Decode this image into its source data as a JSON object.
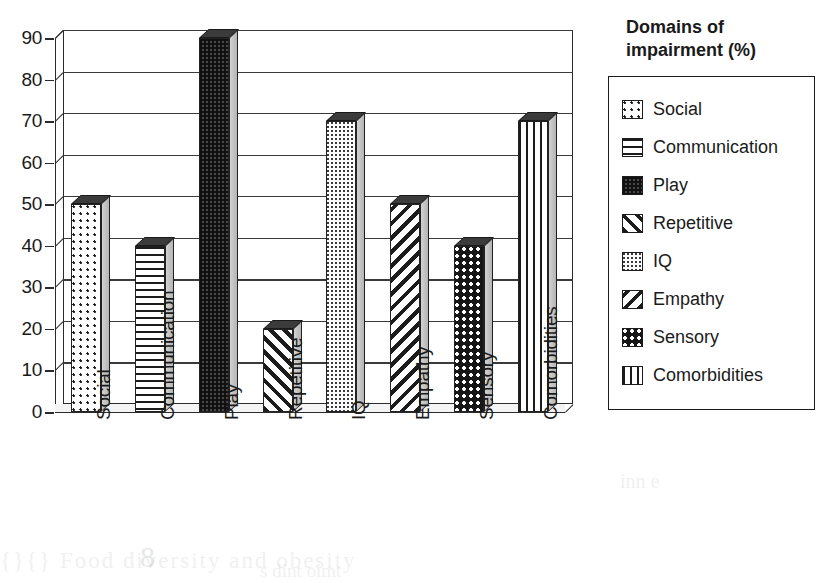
{
  "chart_data": {
    "type": "bar",
    "title": "",
    "xlabel": "",
    "ylabel": "",
    "ylim": [
      0,
      90
    ],
    "ytick_step": 10,
    "yticks": [
      0,
      10,
      20,
      30,
      40,
      50,
      60,
      70,
      80,
      90
    ],
    "grid": true,
    "legend_position": "right",
    "legend_title": "Domains of\nimpairment (%)",
    "categories": [
      "Social",
      "Communication",
      "Play",
      "Repetitive",
      "IQ",
      "Empathy",
      "Sensory",
      "Comorbidities"
    ],
    "values": [
      50,
      40,
      90,
      20,
      70,
      50,
      40,
      70
    ],
    "series": [
      {
        "name": "Domains of impairment (%)",
        "values": [
          50,
          40,
          90,
          20,
          70,
          50,
          40,
          70
        ]
      }
    ],
    "points": [
      {
        "category": "Social",
        "value": 50,
        "pattern": "sparse-dots"
      },
      {
        "category": "Communication",
        "value": 40,
        "pattern": "horizontal-lines"
      },
      {
        "category": "Play",
        "value": 90,
        "pattern": "dense-checker"
      },
      {
        "category": "Repetitive",
        "value": 20,
        "pattern": "diagonal-forward"
      },
      {
        "category": "IQ",
        "value": 70,
        "pattern": "fine-dots"
      },
      {
        "category": "Empathy",
        "value": 50,
        "pattern": "diagonal-backward"
      },
      {
        "category": "Sensory",
        "value": 40,
        "pattern": "dark-dots"
      },
      {
        "category": "Comorbidities",
        "value": 70,
        "pattern": "vertical-lines"
      }
    ]
  },
  "legend": {
    "title": "Domains of\nimpairment (%)",
    "items": [
      {
        "label": "Social",
        "pattern": "sparse-dots"
      },
      {
        "label": "Communication",
        "pattern": "horizontal-lines"
      },
      {
        "label": "Play",
        "pattern": "dense-checker"
      },
      {
        "label": "Repetitive",
        "pattern": "diagonal-forward"
      },
      {
        "label": "IQ",
        "pattern": "fine-dots"
      },
      {
        "label": "Empathy",
        "pattern": "diagonal-backward"
      },
      {
        "label": "Sensory",
        "pattern": "dark-dots"
      },
      {
        "label": "Comorbidities",
        "pattern": "vertical-lines"
      }
    ]
  },
  "axis": {
    "y_labels": [
      "90",
      "80",
      "70",
      "60",
      "50",
      "40",
      "30",
      "20",
      "10",
      "0"
    ],
    "x_labels": [
      "Social",
      "Communication",
      "Play",
      "Repetitive",
      "IQ",
      "Empathy",
      "Sensory",
      "Comorbidities"
    ]
  },
  "colors": {
    "background": "#ffffff",
    "axis": "#2b2b2b",
    "grid": "#3a3a3a",
    "bar_top": "#3b3b3b",
    "bar_side": "#c4c4c4",
    "text": "#1a1a1a"
  }
}
